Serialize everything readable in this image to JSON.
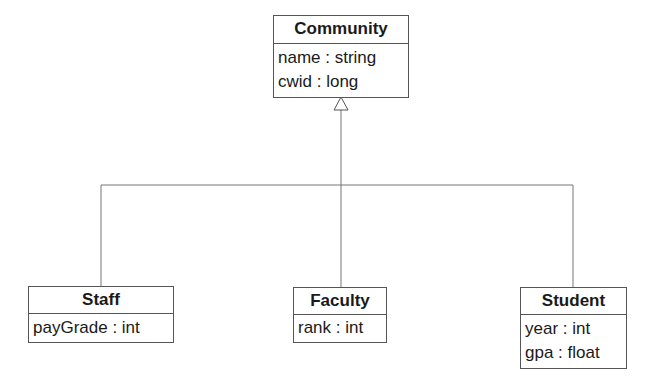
{
  "diagram": {
    "type": "UML class diagram",
    "relationship": "generalization",
    "classes": [
      {
        "id": "community",
        "name": "Community",
        "attributes": [
          "name : string",
          "cwid : long"
        ]
      },
      {
        "id": "staff",
        "name": "Staff",
        "attributes": [
          "payGrade : int"
        ]
      },
      {
        "id": "faculty",
        "name": "Faculty",
        "attributes": [
          "rank : int"
        ]
      },
      {
        "id": "student",
        "name": "Student",
        "attributes": [
          "year : int",
          "gpa : float"
        ]
      }
    ],
    "edges": [
      {
        "from": "staff",
        "to": "community",
        "kind": "inheritance"
      },
      {
        "from": "faculty",
        "to": "community",
        "kind": "inheritance"
      },
      {
        "from": "student",
        "to": "community",
        "kind": "inheritance"
      }
    ],
    "colors": {
      "line": "#555555",
      "background": "#ffffff",
      "text": "#1a1a1a"
    }
  }
}
